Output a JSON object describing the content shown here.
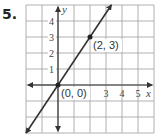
{
  "problem": {
    "number": "5."
  },
  "chart_data": {
    "type": "line",
    "title": "",
    "xlabel": "x",
    "ylabel": "y",
    "xlim": [
      -2,
      6
    ],
    "ylim": [
      -3,
      5
    ],
    "grid": true,
    "x_tick_labels": [
      "3",
      "4",
      "5"
    ],
    "y_tick_labels": [
      "1",
      "2",
      "3",
      "4"
    ],
    "series": [
      {
        "name": "line",
        "equation": "y = 3/2 x",
        "x": [
          -2,
          3.333
        ],
        "y": [
          -3,
          5
        ],
        "arrows": "both"
      }
    ],
    "points": [
      {
        "x": 0,
        "y": 0,
        "label": "(0, 0)"
      },
      {
        "x": 2,
        "y": 3,
        "label": "(2, 3)"
      }
    ],
    "colors": {
      "grid": "#b0b0b0",
      "axis": "#333333",
      "line": "#333333"
    }
  }
}
